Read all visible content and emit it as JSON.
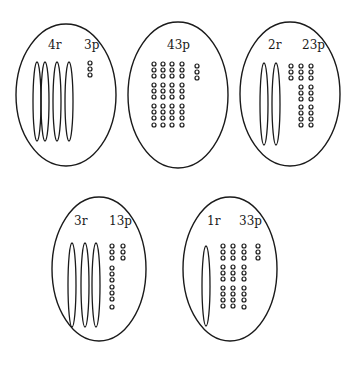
{
  "diagram": {
    "stroke_color": "#1a1a1a",
    "background": "#ffffff",
    "cells": [
      {
        "id": "cell-4r-3p",
        "oval": {
          "cx": 66,
          "cy": 95,
          "rx": 50,
          "ry": 71
        },
        "labels": [
          {
            "text": "4r",
            "x": 48,
            "y": 49
          },
          {
            "text": "3p",
            "x": 84,
            "y": 49
          }
        ],
        "rods": {
          "count": 4,
          "xs": [
            37,
            45,
            57,
            69
          ],
          "y_top": 62,
          "y_bot": 141,
          "rx": 4
        },
        "dots": {
          "count": 3,
          "columns": [
            {
              "x": 90,
              "ys": [
                63,
                69,
                75
              ]
            }
          ]
        }
      },
      {
        "id": "cell-43p",
        "oval": {
          "cx": 178,
          "cy": 95,
          "rx": 50,
          "ry": 73
        },
        "labels": [
          {
            "text": "43p",
            "x": 167,
            "y": 49
          }
        ],
        "rods": {
          "count": 0,
          "xs": [],
          "y_top": 0,
          "y_bot": 0,
          "rx": 4
        },
        "dots": {
          "count": 43,
          "columns": [
            {
              "x": 154,
              "ys": [
                64,
                70,
                76,
                85,
                91,
                97,
                106,
                112,
                118,
                125
              ]
            },
            {
              "x": 163,
              "ys": [
                64,
                70,
                76,
                85,
                91,
                97,
                106,
                112,
                118,
                125
              ]
            },
            {
              "x": 172,
              "ys": [
                64,
                70,
                76,
                85,
                91,
                97,
                106,
                112,
                118,
                125
              ]
            },
            {
              "x": 182,
              "ys": [
                64,
                70,
                76,
                85,
                91,
                97,
                106,
                112,
                118,
                125
              ]
            },
            {
              "x": 197,
              "ys": [
                66,
                72,
                78
              ]
            }
          ]
        }
      },
      {
        "id": "cell-2r-23p",
        "oval": {
          "cx": 290,
          "cy": 94,
          "rx": 50,
          "ry": 72
        },
        "labels": [
          {
            "text": "2r",
            "x": 268,
            "y": 49
          },
          {
            "text": "23p",
            "x": 302,
            "y": 49
          }
        ],
        "rods": {
          "count": 2,
          "xs": [
            264,
            276
          ],
          "y_top": 63,
          "y_bot": 145,
          "rx": 4
        },
        "dots": {
          "count": 23,
          "columns": [
            {
              "x": 291,
              "ys": [
                66,
                72,
                78
              ]
            },
            {
              "x": 301,
              "ys": [
                66,
                72,
                78,
                87,
                93,
                99,
                107,
                113,
                119,
                125
              ]
            },
            {
              "x": 311,
              "ys": [
                66,
                72,
                78,
                87,
                93,
                99,
                107,
                113,
                119,
                125
              ]
            }
          ]
        }
      },
      {
        "id": "cell-3r-13p",
        "oval": {
          "cx": 99,
          "cy": 269,
          "rx": 47,
          "ry": 72
        },
        "labels": [
          {
            "text": "3r",
            "x": 74,
            "y": 225
          },
          {
            "text": "13p",
            "x": 109,
            "y": 225
          }
        ],
        "rods": {
          "count": 3,
          "xs": [
            72,
            85,
            96
          ],
          "y_top": 243,
          "y_bot": 327,
          "rx": 4
        },
        "dots": {
          "count": 13,
          "columns": [
            {
              "x": 112,
              "ys": [
                246,
                252,
                258,
                268,
                274,
                280,
                287,
                293,
                299,
                307
              ]
            },
            {
              "x": 123,
              "ys": [
                246,
                252,
                258
              ]
            }
          ]
        }
      },
      {
        "id": "cell-1r-33p",
        "oval": {
          "cx": 230,
          "cy": 269,
          "rx": 47,
          "ry": 72
        },
        "labels": [
          {
            "text": "1r",
            "x": 207,
            "y": 225
          },
          {
            "text": "33p",
            "x": 239,
            "y": 225
          }
        ],
        "rods": {
          "count": 1,
          "xs": [
            206
          ],
          "y_top": 246,
          "y_bot": 326,
          "rx": 4
        },
        "dots": {
          "count": 33,
          "columns": [
            {
              "x": 223,
              "ys": [
                246,
                252,
                258,
                267,
                273,
                279,
                288,
                294,
                300,
                306
              ]
            },
            {
              "x": 233,
              "ys": [
                246,
                252,
                258,
                267,
                273,
                279,
                288,
                294,
                300,
                306
              ]
            },
            {
              "x": 244,
              "ys": [
                246,
                252,
                258,
                267,
                273,
                279,
                288,
                294,
                300,
                307
              ]
            },
            {
              "x": 258,
              "ys": [
                246,
                252,
                258
              ]
            }
          ]
        }
      }
    ]
  }
}
